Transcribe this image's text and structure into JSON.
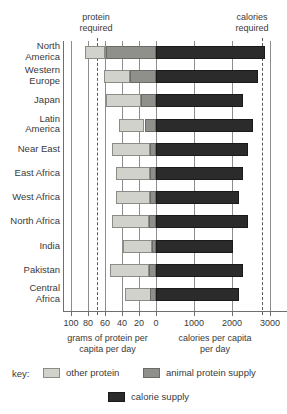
{
  "annotations": {
    "protein_required": "protein\nrequired",
    "calories_required": "calories\nrequired"
  },
  "axes": {
    "protein_title": "grams of protein per\ncapita per day",
    "calorie_title": "calories per capita\nper day",
    "protein_ticks": [
      "100",
      "80",
      "60",
      "40",
      "20",
      "0"
    ],
    "calorie_ticks": [
      "1000",
      "2000",
      "3000"
    ]
  },
  "key": {
    "label": "key:",
    "other_protein": "other protein",
    "animal_protein": "animal protein supply",
    "calorie_supply": "calorie supply",
    "colors": {
      "other_protein": "#d2d2cd",
      "animal_protein": "#8f8f8c",
      "calorie_supply": "#2b2b2b"
    }
  },
  "chart_data": {
    "type": "bar",
    "title": "",
    "subtitle": "",
    "orientation": "horizontal",
    "layout": "diverging-dual-axis",
    "grid": true,
    "legend_position": "bottom",
    "xlabel_left": "grams of protein per capita per day",
    "xlabel_right": "calories per capita per day",
    "ylabel": "",
    "xlim_left": [
      0,
      100
    ],
    "xlim_right": [
      0,
      3000
    ],
    "xticks_left": [
      100,
      80,
      60,
      40,
      20,
      0
    ],
    "xticks_right": [
      0,
      1000,
      2000,
      3000
    ],
    "reference_lines": [
      {
        "name": "protein required",
        "axis": "left",
        "value": 70
      },
      {
        "name": "calories required",
        "axis": "right",
        "value": 2800
      }
    ],
    "categories": [
      "North America",
      "Western Europe",
      "Japan",
      "Latin America",
      "Near East",
      "East Africa",
      "West Africa",
      "North Africa",
      "India",
      "Pakistan",
      "Central Africa"
    ],
    "series": [
      {
        "name": "other protein",
        "axis": "left",
        "units": "grams per capita per day",
        "values": [
          24,
          30,
          41,
          30,
          45,
          40,
          40,
          44,
          34,
          46,
          30
        ]
      },
      {
        "name": "animal protein supply",
        "axis": "left",
        "units": "grams per capita per day",
        "values": [
          59,
          31,
          18,
          13,
          7,
          7,
          7,
          8,
          5,
          8,
          7
        ]
      },
      {
        "name": "calorie supply",
        "axis": "right",
        "units": "calories per capita per day",
        "values": [
          2870,
          2680,
          2290,
          2550,
          2420,
          2280,
          2180,
          2420,
          2030,
          2290,
          2180
        ]
      }
    ]
  }
}
